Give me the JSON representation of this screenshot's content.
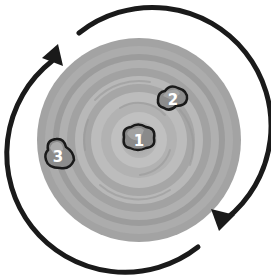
{
  "diagram": {
    "title": "",
    "center": [
      139,
      140
    ],
    "disk": {
      "radius": 102,
      "colors": {
        "outer": "#a3a3a3",
        "ring_dark": "#9a9a9a",
        "ring_light": "#b6b6b6",
        "inner_light": "#bcbcbc",
        "core": "#a8a8a8"
      }
    },
    "rotation": {
      "direction": "clockwise",
      "arrow_color": "#1a1a1a",
      "arrow_radius": 118
    },
    "rocks": [
      {
        "id": "rock-1",
        "label": "1",
        "position": "center"
      },
      {
        "id": "rock-2",
        "label": "2",
        "position": "upper-right, middle"
      },
      {
        "id": "rock-3",
        "label": "3",
        "position": "left edge"
      }
    ]
  }
}
